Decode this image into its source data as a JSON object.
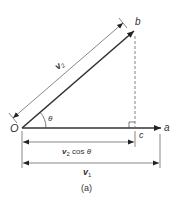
{
  "diagram": {
    "caption": "(a)",
    "points": {
      "origin": "O",
      "a": "a",
      "b": "b",
      "c": "c"
    },
    "angle": "θ",
    "dimensions": {
      "v2": {
        "base": "v",
        "sub": "2"
      },
      "v2cos": {
        "base": "v",
        "sub": "2",
        "suffix": " cos ",
        "angle": "θ"
      },
      "v1": {
        "base": "v",
        "sub": "1"
      }
    },
    "colors": {
      "line": "#333333",
      "thin": "#555555",
      "dashed": "#666666"
    }
  }
}
